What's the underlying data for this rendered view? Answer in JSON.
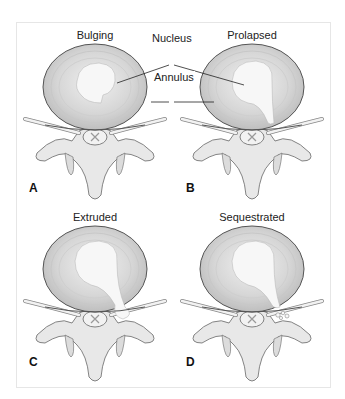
{
  "figure": {
    "panels": [
      {
        "letter": "A",
        "title": "Bulging",
        "stage": "bulging"
      },
      {
        "letter": "B",
        "title": "Prolapsed",
        "stage": "prolapsed"
      },
      {
        "letter": "C",
        "title": "Extruded",
        "stage": "extruded"
      },
      {
        "letter": "D",
        "title": "Sequestrated",
        "stage": "sequestrated"
      }
    ],
    "callouts": {
      "nucleus": "Nucleus",
      "annulus": "Annulus"
    },
    "colors": {
      "background": "#ffffff",
      "disc_fill": "#d9d9d9",
      "disc_ring": "#bdbdbd",
      "nucleus_fill": "#f4f4f4",
      "bone_fill": "#e8e8e8",
      "outline": "#555555",
      "text": "#222222"
    }
  }
}
